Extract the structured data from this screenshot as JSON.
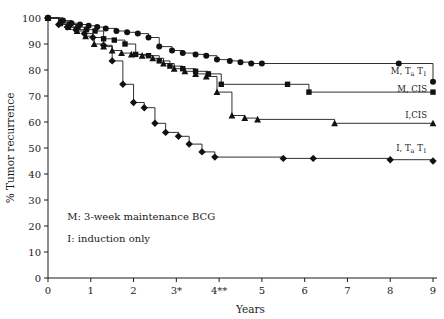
{
  "chart_data": {
    "type": "line",
    "title": "",
    "xlabel": "Years",
    "ylabel": "% Tumor recurrence",
    "xlim": [
      0,
      9
    ],
    "ylim": [
      0,
      100
    ],
    "grid": false,
    "legend_position": "right-inline",
    "x_ticks": [
      "0",
      "1",
      "2",
      "3*",
      "4**",
      "5",
      "6",
      "7",
      "8",
      "9"
    ],
    "x_tick_values": [
      0,
      1,
      2,
      3,
      4,
      5,
      6,
      7,
      8,
      9
    ],
    "y_ticks": [
      "0",
      "10",
      "20",
      "30",
      "40",
      "50",
      "60",
      "70",
      "80",
      "90",
      "100"
    ],
    "y_tick_values": [
      0,
      10,
      20,
      30,
      40,
      50,
      60,
      70,
      80,
      90,
      100
    ],
    "step_type": "post",
    "series": [
      {
        "name": "M, Ta T1",
        "label_main": "M, T",
        "label_sub1": "a",
        "label_mid": " T",
        "label_sub2": "1",
        "marker": "circle",
        "color": "#111111",
        "label_x": 9.0,
        "label_y": 78.5,
        "x": [
          0.0,
          0.35,
          0.55,
          0.75,
          0.95,
          1.15,
          1.35,
          1.6,
          1.85,
          2.1,
          2.35,
          2.6,
          2.9,
          3.15,
          3.45,
          3.7,
          3.95,
          4.25,
          4.5,
          4.75,
          5.0,
          8.2,
          9.0
        ],
        "y": [
          100,
          99,
          98,
          97.5,
          97,
          96.5,
          96,
          95,
          94.5,
          94,
          92.5,
          89,
          87.5,
          86.5,
          86,
          85.5,
          84,
          83.5,
          83,
          82.5,
          82.5,
          82.5,
          75.5
        ]
      },
      {
        "name": "M, CIS",
        "label_main": "M, CIS",
        "marker": "square",
        "color": "#111111",
        "label_x": 9.0,
        "label_y": 71.5,
        "x": [
          0.0,
          0.3,
          0.5,
          0.7,
          0.9,
          1.1,
          1.3,
          1.55,
          1.8,
          2.05,
          2.35,
          2.6,
          2.85,
          3.15,
          3.45,
          3.75,
          4.05,
          5.6,
          6.1,
          9.0
        ],
        "y": [
          100,
          98.5,
          97.5,
          96.5,
          95.5,
          95,
          92,
          91.5,
          90,
          86,
          85.5,
          83.5,
          81.5,
          80.5,
          79.5,
          78.5,
          74.5,
          74.5,
          71.5,
          71.5
        ]
      },
      {
        "name": "I, CIS",
        "label_main": "I,CIS",
        "marker": "triangle",
        "color": "#111111",
        "label_x": 9.0,
        "label_y": 61.5,
        "x": [
          0.0,
          0.28,
          0.48,
          0.68,
          0.88,
          1.08,
          1.3,
          1.5,
          1.72,
          1.95,
          2.2,
          2.45,
          2.7,
          2.95,
          3.2,
          3.45,
          3.7,
          3.95,
          4.3,
          4.6,
          4.9,
          6.7,
          9.0
        ],
        "y": [
          100,
          98,
          96.5,
          95,
          93,
          90,
          89,
          87.5,
          86.5,
          86,
          85.5,
          84.5,
          82.5,
          80.5,
          79.5,
          78.5,
          77.5,
          71.5,
          62.5,
          61.5,
          61,
          59.5,
          59.5
        ]
      },
      {
        "name": "I, Ta T1",
        "label_main": "I, T",
        "label_sub1": "a",
        "label_mid": " T",
        "label_sub2": "1",
        "marker": "diamond",
        "color": "#111111",
        "label_x": 9.0,
        "label_y": 49.0,
        "x": [
          0.0,
          0.25,
          0.45,
          0.65,
          0.85,
          1.05,
          1.3,
          1.5,
          1.75,
          2.0,
          2.25,
          2.5,
          2.75,
          3.05,
          3.3,
          3.6,
          3.9,
          5.5,
          6.2,
          8.0,
          9.0
        ],
        "y": [
          100,
          97.5,
          96.5,
          95.5,
          94,
          92.5,
          89.5,
          83.5,
          74.5,
          67.5,
          65.5,
          59.5,
          56,
          54.5,
          51.5,
          48.5,
          46.5,
          46,
          46,
          45.5,
          45
        ]
      }
    ],
    "annotations": [
      {
        "text": "M: 3-week maintenance BCG",
        "x": 0.45,
        "y": 22.5
      },
      {
        "text": "I: induction only",
        "x": 0.45,
        "y": 14.0
      }
    ]
  }
}
